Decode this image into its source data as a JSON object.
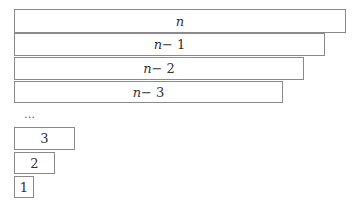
{
  "diagram": {
    "bars": [
      {
        "label": "n",
        "var": "n",
        "suffix": ""
      },
      {
        "label": "n − 1",
        "var": "n",
        "suffix": " − 1"
      },
      {
        "label": "n − 2",
        "var": "n",
        "suffix": " − 2"
      },
      {
        "label": "n − 3",
        "var": "n",
        "suffix": " − 3"
      },
      {
        "label": "3",
        "var": "",
        "suffix": "3"
      },
      {
        "label": "2",
        "var": "",
        "suffix": "2"
      },
      {
        "label": "1",
        "var": "",
        "suffix": "1"
      }
    ],
    "ellipsis": "…"
  }
}
